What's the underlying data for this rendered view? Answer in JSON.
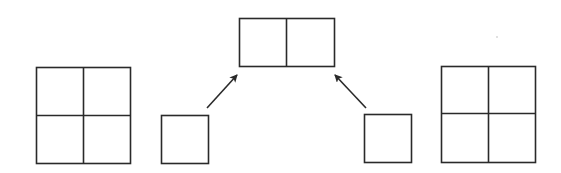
{
  "diagram": {
    "stroke_color": "#2a2a2a",
    "background": "#ffffff",
    "shapes": {
      "left_grid": {
        "x": 36,
        "y": 67,
        "w": 94,
        "h": 96,
        "rows": 2,
        "cols": 2
      },
      "left_small_square": {
        "x": 161,
        "y": 115,
        "w": 47,
        "h": 48
      },
      "top_rect": {
        "x": 239,
        "y": 18,
        "w": 95,
        "h": 48,
        "rows": 1,
        "cols": 2
      },
      "right_small_square": {
        "x": 364,
        "y": 114,
        "w": 47,
        "h": 48
      },
      "right_grid": {
        "x": 441,
        "y": 66,
        "w": 94,
        "h": 96,
        "rows": 2,
        "cols": 2
      }
    },
    "arrows": [
      {
        "name": "left-arrow",
        "from": [
          207,
          108
        ],
        "to": [
          237,
          75
        ]
      },
      {
        "name": "right-arrow",
        "from": [
          366,
          108
        ],
        "to": [
          335,
          75
        ]
      }
    ]
  }
}
